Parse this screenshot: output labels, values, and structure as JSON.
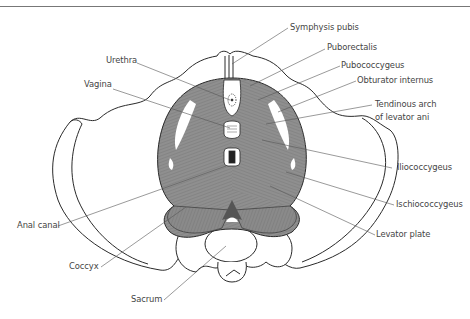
{
  "figure": {
    "colors": {
      "muscle_fill": "#8f8f8f",
      "muscle_dark": "#6e6e6e",
      "outline": "#2a2a2a",
      "leader_line": "#555555",
      "label_text": "#444444",
      "background": "#ffffff"
    }
  },
  "labels": {
    "symphysis_pubis": "Symphysis pubis",
    "urethra": "Urethra",
    "puborectalis": "Puborectalis",
    "pubococcygeus": "Pubococcygeus",
    "vagina": "Vagina",
    "obturator_internus": "Obturator internus",
    "tendinous_arch_line1": "Tendinous arch",
    "tendinous_arch_line2": "of levator ani",
    "iliococcygeus": "Iliococcygeus",
    "ischiococcygeus": "Ischiococcygeus",
    "anal_canal": "Anal canal",
    "levator_plate": "Levator plate",
    "coccyx": "Coccyx",
    "sacrum": "Sacrum"
  }
}
